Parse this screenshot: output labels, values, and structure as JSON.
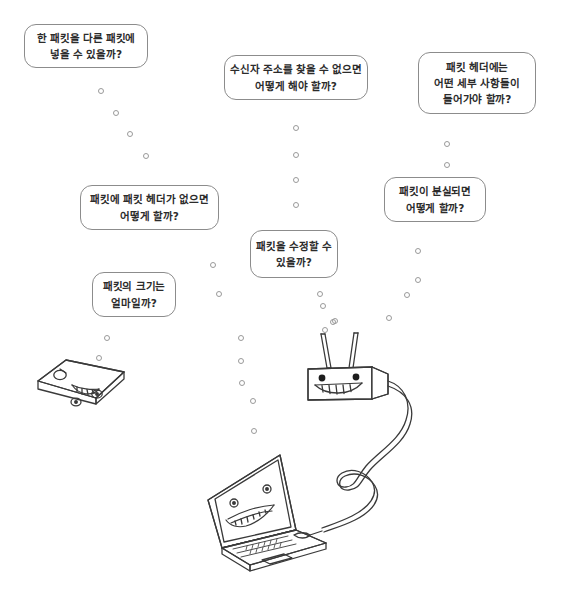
{
  "scene": {
    "title": "패킷 관련 질문 일러스트",
    "width": 568,
    "height": 591,
    "background_color": "#ffffff",
    "line_color": "#3a3a3a",
    "bubble_border_color": "#8c8c8c",
    "text_color": "#2b2b2b",
    "packet_color": "#9a9a9a"
  },
  "bubbles": [
    {
      "name": "question-packet-in-packet",
      "lines": [
        "한 패킷을 다른 패킷에",
        "넣을 수 있을까?"
      ],
      "x": 24,
      "y": 24,
      "w": 124,
      "h": 44
    },
    {
      "name": "question-receiver-address-not-found",
      "lines": [
        "수신자 주소를 찾을 수 없으면",
        "어떻게 해야 할까?"
      ],
      "x": 224,
      "y": 55,
      "w": 144,
      "h": 45
    },
    {
      "name": "question-packet-header-details",
      "lines": [
        "패킷 헤더에는",
        "어떤 세부 사항들이",
        "들어가야 할까?"
      ],
      "x": 418,
      "y": 52,
      "w": 118,
      "h": 62
    },
    {
      "name": "question-no-packet-header",
      "lines": [
        "패킷에 패킷 헤더가 없으면",
        "어떻게 할까?"
      ],
      "x": 80,
      "y": 185,
      "w": 139,
      "h": 45
    },
    {
      "name": "question-packet-lost",
      "lines": [
        "패킷이 분실되면",
        "어떻게 할까?"
      ],
      "x": 384,
      "y": 177,
      "w": 102,
      "h": 45
    },
    {
      "name": "question-modify-packet",
      "lines": [
        "패킷을 수정할 수",
        "있을까?"
      ],
      "x": 250,
      "y": 230,
      "w": 88,
      "h": 48
    },
    {
      "name": "question-packet-size",
      "lines": [
        "패킷의 크기는",
        "얼마일까?"
      ],
      "x": 92,
      "y": 272,
      "w": 84,
      "h": 45
    }
  ],
  "packet_trails": [
    {
      "name": "trail-left-upper",
      "points": [
        [
          98,
          88
        ],
        [
          113,
          110
        ],
        [
          127,
          131
        ],
        [
          143,
          153
        ]
      ]
    },
    {
      "name": "trail-center-upper",
      "points": [
        [
          293,
          125
        ],
        [
          293,
          152
        ],
        [
          293,
          177
        ],
        [
          293,
          202
        ]
      ]
    },
    {
      "name": "trail-right-upper",
      "points": [
        [
          444,
          141
        ],
        [
          444,
          162
        ]
      ]
    },
    {
      "name": "trail-left-lower",
      "points": [
        [
          210,
          262
        ],
        [
          216,
          291
        ],
        [
          104,
          335
        ],
        [
          96,
          355
        ]
      ]
    },
    {
      "name": "trail-center-lower",
      "points": [
        [
          317,
          291
        ],
        [
          320,
          303
        ],
        [
          322,
          327
        ],
        [
          238,
          335
        ],
        [
          238,
          358
        ],
        [
          239,
          380
        ],
        [
          250,
          398
        ],
        [
          251,
          428
        ]
      ]
    },
    {
      "name": "trail-right-lower",
      "points": [
        [
          415,
          248
        ],
        [
          415,
          277
        ],
        [
          404,
          292
        ],
        [
          330,
          319
        ],
        [
          332,
          318
        ],
        [
          386,
          315
        ]
      ]
    }
  ],
  "devices": [
    {
      "name": "mobile-phone-character",
      "label": "phone",
      "description": "모바일 기기 캐릭터"
    },
    {
      "name": "router-character",
      "label": "router",
      "description": "안테나 두 개가 달린 라우터 캐릭터"
    },
    {
      "name": "laptop-character",
      "label": "laptop",
      "description": "노트북 캐릭터"
    },
    {
      "name": "network-cable",
      "label": "cable",
      "description": "라우터와 노트북을 잇는 케이블"
    }
  ]
}
